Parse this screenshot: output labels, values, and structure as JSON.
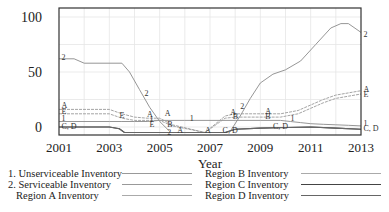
{
  "chart_data": {
    "type": "line",
    "title": "",
    "xlabel": "Year",
    "ylabel": "",
    "xlim": [
      2001,
      2013
    ],
    "ylim": [
      -7,
      108
    ],
    "grid": true,
    "x_ticks": [
      "2001",
      "2003",
      "2005",
      "2007",
      "2009",
      "2011",
      "2013"
    ],
    "y_ticks": [
      "0",
      "50",
      "100"
    ],
    "legend_position": "bottom",
    "series": [
      {
        "name": "1. Unserviceable Inventory",
        "marker": "1",
        "color": "#8a8a8a",
        "x": [
          2001,
          2003,
          2003.5,
          2004,
          2004.5,
          2005,
          2006,
          2007,
          2008,
          2009,
          2009.8,
          2010.2,
          2010.6,
          2011,
          2011.5,
          2012,
          2012.5,
          2013
        ],
        "y": [
          5,
          5,
          5,
          5,
          5,
          6,
          6,
          6,
          6,
          6,
          6,
          5,
          4,
          3,
          2.5,
          2,
          1.5,
          1
        ]
      },
      {
        "name": "2. Serviceable Inventory",
        "marker": "2",
        "color": "#8a8a8a",
        "x": [
          2001,
          2001.6,
          2002,
          2003.5,
          2003.8,
          2004.2,
          2004.6,
          2005,
          2005.4,
          null,
          2007.8,
          2008.2,
          2008.6,
          2009,
          2009.5,
          2010,
          2010.6,
          2011.2,
          2011.8,
          2012.2,
          2012.5,
          2013
        ],
        "y": [
          62,
          62,
          58,
          58,
          50,
          34,
          18,
          5,
          -4,
          null,
          -4,
          10,
          26,
          40,
          48,
          52,
          60,
          75,
          90,
          94,
          94,
          86
        ]
      },
      {
        "name": "Region A Inventory",
        "marker": "A",
        "color": "#9a9a9a",
        "x": [
          2001,
          2003,
          2003.5,
          2004,
          2004.5,
          2005,
          2005.5,
          2006.8,
          2007.6,
          2008,
          2009,
          2009.8,
          2010.5,
          2011,
          2011.5,
          2012,
          2012.5,
          2013
        ],
        "y": [
          16,
          16,
          12,
          9,
          8,
          8,
          2,
          -5,
          10,
          12,
          12,
          12,
          15,
          20,
          25,
          29,
          31,
          33
        ]
      },
      {
        "name": "Region B Inventory",
        "marker": "B",
        "color": "#9a9a9a",
        "x": [
          2001,
          2003,
          2003.5,
          2004,
          2004.5,
          2005,
          2005.5,
          2006.8,
          2007.6,
          2008,
          2009,
          2009.8,
          2010.5,
          2011,
          2011.5,
          2012,
          2012.5,
          2013
        ],
        "y": [
          12,
          12,
          8,
          6,
          6,
          6,
          1,
          -5,
          8,
          9,
          9,
          9,
          12,
          17,
          22,
          26,
          28,
          30
        ]
      },
      {
        "name": "Region C Inventory",
        "marker": "C",
        "color": "#444444",
        "x": [
          2001,
          2003,
          2003.4,
          2003.6,
          2007.6,
          2008,
          2009,
          2010,
          2011,
          2012,
          2013
        ],
        "y": [
          0,
          0,
          -1.5,
          -5,
          -5,
          -2,
          -1,
          -0.5,
          0,
          -1,
          -2
        ]
      },
      {
        "name": "Region D Inventory",
        "marker": "D",
        "color": "#666666",
        "x": [
          2001,
          2003,
          2003.4,
          2003.6,
          2007.6,
          2008,
          2009,
          2010,
          2011,
          2012,
          2013
        ],
        "y": [
          0,
          0,
          -1.5,
          -5,
          -5,
          -2,
          -1,
          -0.5,
          0,
          -1,
          -2
        ]
      }
    ]
  },
  "axes": {
    "y_labels": [
      "100",
      "50",
      "0"
    ],
    "x_labels": [
      "2001",
      "2003",
      "2005",
      "2007",
      "2009",
      "2011",
      "2013"
    ],
    "x_title": "Year"
  },
  "legend": {
    "left": [
      {
        "label": "1. Unserviceable Inventory"
      },
      {
        "label": "2. Serviceable Inventory"
      },
      {
        "label": "Region A Inventory"
      }
    ],
    "right": [
      {
        "label": "Region B Inventory"
      },
      {
        "label": "Region C Inventory"
      },
      {
        "label": "Region D Inventory"
      }
    ]
  },
  "end_labels": {
    "series2": "2",
    "regionA": "A",
    "regionB": "B",
    "series1": "1",
    "cd": "C, D"
  }
}
